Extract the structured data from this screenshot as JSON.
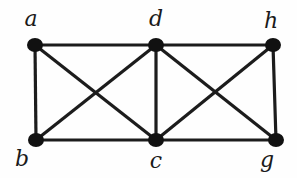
{
  "graph": {
    "nodes": [
      {
        "id": "a",
        "label": "a",
        "x": 35,
        "y": 45,
        "lx": 31,
        "ly": 19
      },
      {
        "id": "d",
        "label": "d",
        "x": 156,
        "y": 45,
        "lx": 156,
        "ly": 19
      },
      {
        "id": "h",
        "label": "h",
        "x": 273,
        "y": 45,
        "lx": 271,
        "ly": 21
      },
      {
        "id": "b",
        "label": "b",
        "x": 36,
        "y": 140,
        "lx": 22,
        "ly": 159
      },
      {
        "id": "c",
        "label": "c",
        "x": 156,
        "y": 140,
        "lx": 156,
        "ly": 161
      },
      {
        "id": "g",
        "label": "g",
        "x": 276,
        "y": 140,
        "lx": 267,
        "ly": 160
      }
    ],
    "edges": [
      [
        "a",
        "d"
      ],
      [
        "d",
        "h"
      ],
      [
        "a",
        "b"
      ],
      [
        "b",
        "c"
      ],
      [
        "c",
        "g"
      ],
      [
        "h",
        "g"
      ],
      [
        "d",
        "c"
      ],
      [
        "a",
        "c"
      ],
      [
        "b",
        "d"
      ],
      [
        "d",
        "g"
      ],
      [
        "c",
        "h"
      ]
    ],
    "colors": {
      "edge": "#1c1c1c",
      "node": "#111111",
      "background": "#fefefe"
    }
  }
}
